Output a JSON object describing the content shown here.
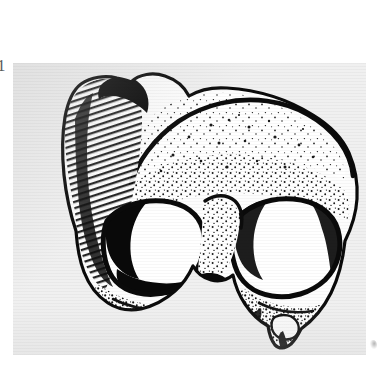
{
  "page": {
    "background_color": "#ffffff",
    "width": 387,
    "height": 385
  },
  "figure": {
    "number_label": "1",
    "caption": "",
    "panel": {
      "background_color": "#f0f0f0",
      "ink_color": "#111111",
      "left": 13,
      "top": 63,
      "width": 353,
      "height": 292
    },
    "illustration": {
      "subject": "fossil hominin cranium",
      "view": "anterior (frontal) view",
      "technique": "stipple and line drawing, halftone scan",
      "features": [
        "supraorbital torus (brow ridge)",
        "frontal squama",
        "left orbit",
        "right orbit",
        "glabella",
        "left temporal region",
        "zygomatic process",
        "nasal root",
        "broken inferior margin"
      ]
    }
  },
  "marks": {
    "corner_smudge": "scan-artifact-smudge"
  }
}
